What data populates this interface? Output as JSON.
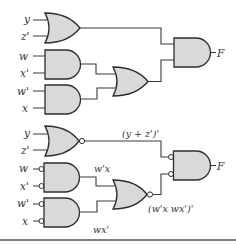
{
  "diagram": {
    "type": "logic-circuit",
    "top_circuit": {
      "inputs": [
        "y",
        "z'",
        "w",
        "x'",
        "w'",
        "x"
      ],
      "gates": [
        {
          "id": "or1",
          "type": "OR",
          "inputs": [
            "y",
            "z'"
          ]
        },
        {
          "id": "and1",
          "type": "AND",
          "inputs": [
            "w",
            "x'"
          ]
        },
        {
          "id": "and2",
          "type": "AND",
          "inputs": [
            "w'",
            "x"
          ]
        },
        {
          "id": "or2",
          "type": "OR",
          "inputs": [
            "and1",
            "and2"
          ]
        },
        {
          "id": "and_out",
          "type": "AND",
          "inputs": [
            "or1",
            "or2"
          ],
          "output": "F"
        }
      ],
      "output_label": "F"
    },
    "bottom_circuit": {
      "inputs": [
        "y",
        "z'",
        "w",
        "x'",
        "w'",
        "x"
      ],
      "gates": [
        {
          "id": "nor1",
          "type": "NOR",
          "inputs": [
            "y",
            "z'"
          ],
          "output_expr": "(y + z')'"
        },
        {
          "id": "nand_inv1",
          "type": "AND-invert-inputs",
          "inputs": [
            "w",
            "x'"
          ],
          "output_expr": "w'x"
        },
        {
          "id": "nand_inv2",
          "type": "AND-invert-inputs",
          "inputs": [
            "w'",
            "x"
          ],
          "output_expr": "wx'"
        },
        {
          "id": "nor2",
          "type": "NOR",
          "inputs": [
            "w'x",
            "wx'"
          ],
          "output_expr": "(w'x wx')'"
        },
        {
          "id": "and_out",
          "type": "AND-invert-inputs",
          "inputs": [
            "nor1",
            "nor2"
          ],
          "output": "F"
        }
      ],
      "labels": {
        "nor1_out": "(y + z')'",
        "and1_out": "w'x",
        "and2_out": "wx'",
        "nor2_out": "(w'x wx')'",
        "output": "F"
      }
    }
  },
  "labels": {
    "top": {
      "y": "y",
      "z": "z'",
      "w": "w",
      "xp": "x'",
      "wp": "w'",
      "x": "x",
      "F": "F"
    },
    "bottom": {
      "y": "y",
      "z": "z'",
      "w": "w",
      "xp": "x'",
      "wp": "w'",
      "x": "x",
      "F": "F",
      "e1": "(y + z')'",
      "e2": "w'x",
      "e3": "wx'",
      "e4": "(w'x wx')'"
    }
  },
  "colors": {
    "gate_fill": "#d9d9d9",
    "stroke": "#2e2e2e",
    "background": "#ffffff"
  }
}
